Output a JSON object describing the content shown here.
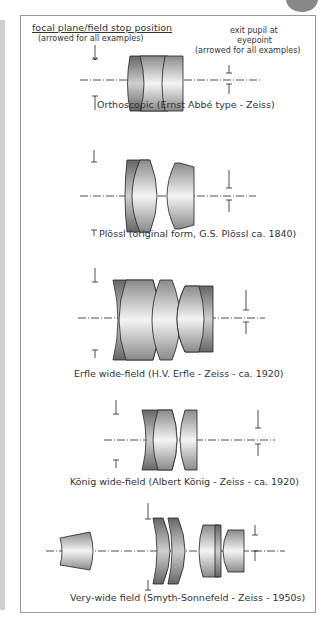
{
  "header": {
    "focal_label": "focal plane/field stop position",
    "focal_sub": "(arrowed for all examples)",
    "exit_label_1": "exit pupil at",
    "exit_label_2": "eyepoint",
    "exit_sub": "(arrowed for all examples)"
  },
  "designs": [
    {
      "name": "Orthoscopic (Ernst Abbé type - Zeiss)"
    },
    {
      "name": "Plössl (original form, G.S. Plössl ca. 1840)"
    },
    {
      "name": "Erfle wide-field (H.V. Erfle - Zeiss - ca. 1920)"
    },
    {
      "name": "König wide-field (Albert König - Zeiss - ca. 1920)"
    },
    {
      "name": "Very-wide field (Smyth-Sonnefeld - Zeiss - 1950s)"
    }
  ],
  "colors": {
    "lens_dark": "#7a7a7a",
    "lens_light": "#f2f2f2",
    "frame": "#999999"
  }
}
